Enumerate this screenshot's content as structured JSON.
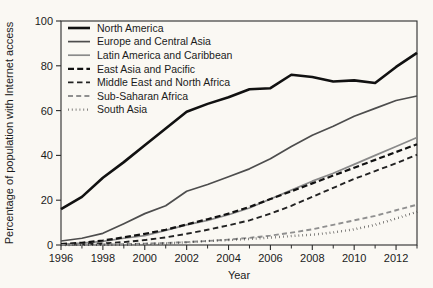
{
  "chart_data": {
    "type": "line",
    "title": "",
    "xlabel": "Year",
    "ylabel": "Percentage of population with Internet access",
    "xlim": [
      1996,
      2013
    ],
    "ylim": [
      0,
      100
    ],
    "grid": false,
    "legend_position": "top-left",
    "x": [
      1996,
      1997,
      1998,
      1999,
      2000,
      2001,
      2002,
      2003,
      2004,
      2005,
      2006,
      2007,
      2008,
      2009,
      2010,
      2011,
      2012,
      2013
    ],
    "xticks": [
      1996,
      1998,
      2000,
      2002,
      2004,
      2006,
      2008,
      2010,
      2012
    ],
    "xtick_labels": [
      "1996",
      "1998",
      "2000",
      "2002",
      "2004",
      "2006",
      "2008",
      "2010",
      "2012"
    ],
    "xticks_minor": [
      1997,
      1999,
      2001,
      2003,
      2005,
      2007,
      2009,
      2011,
      2013
    ],
    "yticks": [
      0,
      20,
      40,
      60,
      80,
      100
    ],
    "ytick_labels": [
      "0",
      "20",
      "40",
      "60",
      "80",
      "100"
    ],
    "series": [
      {
        "name": "North America",
        "style": "solid",
        "color": "#111111",
        "width": 2.6,
        "dash": "",
        "values": [
          16.0,
          21.5,
          30.0,
          37.0,
          44.5,
          52.0,
          59.5,
          63.0,
          66.0,
          69.5,
          70.0,
          76.0,
          75.0,
          73.0,
          73.5,
          72.3,
          79.5,
          85.8
        ]
      },
      {
        "name": "Europe and Central Asia",
        "style": "solid",
        "color": "#4d4d4d",
        "width": 1.7,
        "dash": "",
        "values": [
          1.8,
          3.0,
          5.2,
          9.5,
          14.0,
          17.5,
          24.0,
          27.0,
          30.5,
          34.0,
          38.5,
          44.0,
          49.0,
          53.0,
          57.5,
          61.0,
          64.5,
          66.5
        ]
      },
      {
        "name": "Latin America and Caribbean",
        "style": "solid",
        "color": "#8a8a8a",
        "width": 1.7,
        "dash": "",
        "values": [
          0.3,
          0.8,
          1.6,
          3.0,
          4.2,
          6.5,
          9.0,
          11.0,
          13.5,
          16.5,
          20.5,
          24.5,
          28.5,
          32.0,
          36.0,
          40.0,
          44.0,
          48.0
        ]
      },
      {
        "name": "East Asia and Pacific",
        "style": "dashed",
        "color": "#111111",
        "width": 2.2,
        "dash": "6,3.2",
        "values": [
          0.4,
          1.0,
          2.0,
          3.4,
          5.0,
          6.8,
          9.2,
          11.5,
          14.0,
          17.0,
          20.5,
          24.0,
          27.5,
          31.0,
          34.5,
          38.0,
          41.5,
          45.0
        ]
      },
      {
        "name": "Middle East and North Africa",
        "style": "dashed",
        "color": "#222222",
        "width": 1.9,
        "dash": "5.5,3.5",
        "values": [
          0.1,
          0.3,
          0.7,
          1.3,
          2.2,
          3.4,
          5.0,
          6.8,
          8.8,
          11.0,
          14.0,
          17.5,
          21.5,
          25.5,
          29.5,
          33.0,
          36.5,
          40.3
        ]
      },
      {
        "name": "Sub-Saharan Africa",
        "style": "dashed",
        "color": "#8f8f8f",
        "width": 1.9,
        "dash": "5,3.2",
        "values": [
          0.05,
          0.1,
          0.2,
          0.35,
          0.6,
          0.9,
          1.3,
          1.8,
          2.4,
          3.2,
          4.2,
          5.5,
          7.0,
          9.0,
          11.0,
          13.0,
          15.5,
          18.0
        ]
      },
      {
        "name": "South Asia",
        "style": "dotted",
        "color": "#111111",
        "width": 2.4,
        "dash": "0.5,3.4",
        "values": [
          0.02,
          0.05,
          0.1,
          0.2,
          0.45,
          0.7,
          1.2,
          1.8,
          2.2,
          2.7,
          3.3,
          4.0,
          4.6,
          5.6,
          7.0,
          9.0,
          11.8,
          14.8
        ]
      }
    ]
  },
  "legend": {
    "items": [
      {
        "label": "North America"
      },
      {
        "label": "Europe and Central Asia"
      },
      {
        "label": "Latin America and Caribbean"
      },
      {
        "label": "East Asia and Pacific"
      },
      {
        "label": "Middle East and North Africa"
      },
      {
        "label": "Sub-Saharan Africa"
      },
      {
        "label": "South Asia"
      }
    ]
  }
}
